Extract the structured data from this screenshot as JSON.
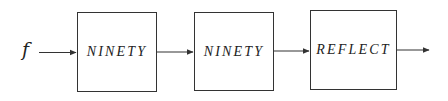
{
  "diagram": {
    "input_label": "f",
    "blocks": [
      {
        "label": "NINETY"
      },
      {
        "label": "NINETY"
      },
      {
        "label": "REFLECT"
      }
    ],
    "colors": {
      "stroke": "#333333",
      "text": "#222222",
      "background": "#ffffff"
    }
  }
}
